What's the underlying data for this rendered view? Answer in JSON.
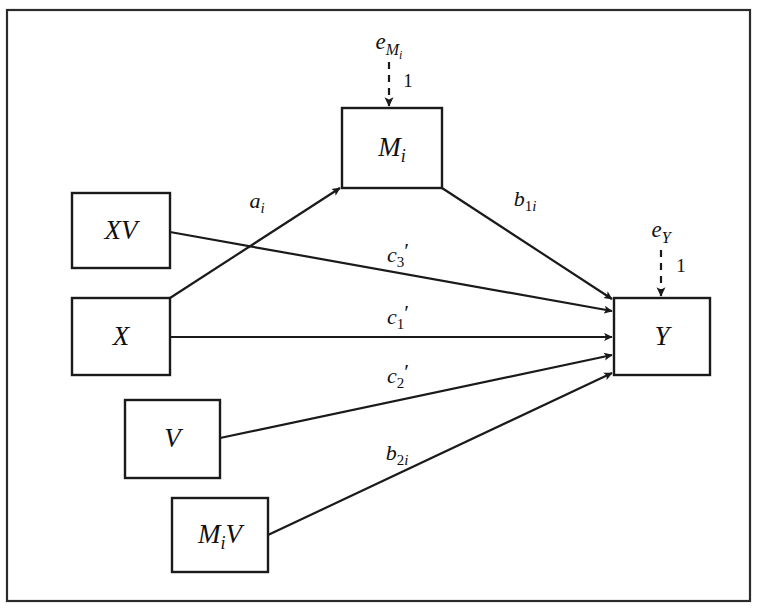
{
  "figure": {
    "name": "moderated-mediation-path-diagram",
    "frame": {
      "x": 7,
      "y": 10,
      "width": 743,
      "height": 591
    },
    "colors": {
      "stroke": "#1a1a1a",
      "frame_stroke": "#2b2b2b",
      "background": "#ffffff",
      "text": "#101010"
    }
  },
  "nodes": [
    {
      "id": "node-mi",
      "name": "node-mi",
      "label_main": "M",
      "label_sub": "i",
      "label_plain": "Mi",
      "x": 342,
      "y": 108,
      "width": 100,
      "height": 80
    },
    {
      "id": "node-xv",
      "name": "node-xv",
      "label_main": "XV",
      "label_sub": "",
      "label_plain": "XV",
      "x": 72,
      "y": 193,
      "width": 98,
      "height": 75
    },
    {
      "id": "node-x",
      "name": "node-x",
      "label_main": "X",
      "label_sub": "",
      "label_plain": "X",
      "x": 72,
      "y": 298,
      "width": 98,
      "height": 77
    },
    {
      "id": "node-v",
      "name": "node-v",
      "label_main": "V",
      "label_sub": "",
      "label_plain": "V",
      "x": 125,
      "y": 400,
      "width": 95,
      "height": 78
    },
    {
      "id": "node-miv",
      "name": "node-miv",
      "label_main": "M",
      "label_sub": "i",
      "label_tail": "V",
      "label_plain": "MiV",
      "x": 172,
      "y": 498,
      "width": 96,
      "height": 74
    },
    {
      "id": "node-y",
      "name": "node-y",
      "label_main": "Y",
      "label_sub": "",
      "label_plain": "Y",
      "x": 614,
      "y": 298,
      "width": 96,
      "height": 77
    }
  ],
  "errors": [
    {
      "id": "error-mi",
      "name": "error-term-mi",
      "label_main": "e",
      "label_sub": "Mi",
      "label_plain": "eMi",
      "label_x": 389,
      "label_y": 44,
      "coefficient": "1",
      "coefficient_x": 408,
      "coefficient_y": 83,
      "line": {
        "x1": 389,
        "y1": 62,
        "x2": 389,
        "y2": 106
      }
    },
    {
      "id": "error-y",
      "name": "error-term-y",
      "label_main": "e",
      "label_sub": "Y",
      "label_plain": "eY",
      "label_x": 661,
      "label_y": 232,
      "coefficient": "1",
      "coefficient_x": 681,
      "coefficient_y": 268,
      "line": {
        "x1": 661,
        "y1": 250,
        "x2": 661,
        "y2": 296
      }
    }
  ],
  "edges": [
    {
      "id": "edge-a-i",
      "name": "path-x-to-mi",
      "from": "X",
      "to": "Mi",
      "label_main": "a",
      "label_sub": "i",
      "label_sub_style": "italic",
      "label_prime": "",
      "label_plain": "ai",
      "label_x": 257,
      "label_y": 203,
      "line": {
        "x1": 170,
        "y1": 298,
        "x2": 340,
        "y2": 188
      }
    },
    {
      "id": "edge-b-1i",
      "name": "path-mi-to-y",
      "from": "Mi",
      "to": "Y",
      "label_main": "b",
      "label_sub": "1i",
      "label_sub_style": "mixed",
      "label_prime": "",
      "label_plain": "b1i",
      "label_x": 525,
      "label_y": 201,
      "line": {
        "x1": 442,
        "y1": 188,
        "x2": 612,
        "y2": 299
      }
    },
    {
      "id": "edge-c3-prime",
      "name": "path-xv-to-y",
      "from": "XV",
      "to": "Y",
      "label_main": "c",
      "label_sub": "3",
      "label_sub_style": "upright",
      "label_prime": "′",
      "label_plain": "c3'",
      "label_x": 398,
      "label_y": 257,
      "line": {
        "x1": 170,
        "y1": 232,
        "x2": 612,
        "y2": 311
      }
    },
    {
      "id": "edge-c1-prime",
      "name": "path-x-to-y",
      "from": "X",
      "to": "Y",
      "label_main": "c",
      "label_sub": "1",
      "label_sub_style": "upright",
      "label_prime": "′",
      "label_plain": "c1'",
      "label_x": 398,
      "label_y": 319,
      "line": {
        "x1": 170,
        "y1": 337,
        "x2": 612,
        "y2": 337
      }
    },
    {
      "id": "edge-c2-prime",
      "name": "path-v-to-y",
      "from": "V",
      "to": "Y",
      "label_main": "c",
      "label_sub": "2",
      "label_sub_style": "upright",
      "label_prime": "′",
      "label_plain": "c2'",
      "label_x": 398,
      "label_y": 378,
      "line": {
        "x1": 220,
        "y1": 438,
        "x2": 612,
        "y2": 355
      }
    },
    {
      "id": "edge-b-2i",
      "name": "path-miv-to-y",
      "from": "MiV",
      "to": "Y",
      "label_main": "b",
      "label_sub": "2i",
      "label_sub_style": "mixed",
      "label_prime": "",
      "label_plain": "b2i",
      "label_x": 397,
      "label_y": 455,
      "line": {
        "x1": 268,
        "y1": 535,
        "x2": 612,
        "y2": 373
      }
    }
  ]
}
